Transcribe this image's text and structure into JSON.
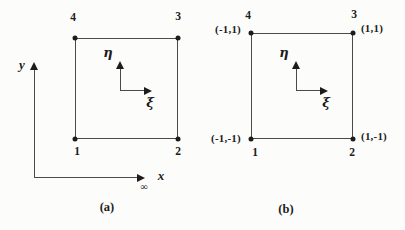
{
  "colors": {
    "ink": "#1c1c1c",
    "line": "#4a4a4a",
    "background": "#fcfcfa"
  },
  "panel_a": {
    "caption": "(a)",
    "y_axis_label": "y",
    "x_axis_label": "x",
    "x_axis_mark": "∞",
    "eta_label": "η",
    "xi_label": "ξ",
    "nodes": {
      "top_left": "4",
      "top_right": "3",
      "bottom_left": "1",
      "bottom_right": "2"
    }
  },
  "panel_b": {
    "caption": "(b)",
    "eta_label": "η",
    "xi_label": "ξ",
    "nodes": {
      "top_left": "4",
      "top_right": "3",
      "bottom_left": "1",
      "bottom_right": "2"
    },
    "coords": {
      "top_left": "(-1,1)",
      "top_right": "(1,1)",
      "bottom_left": "(-1,-1)",
      "bottom_right": "(1,-1)"
    }
  }
}
